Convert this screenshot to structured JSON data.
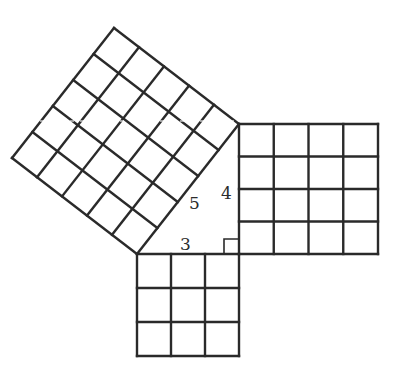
{
  "diagram": {
    "title": "",
    "type": "pythagorean-theorem-squares",
    "colors": {
      "line": "#2a2a2a",
      "background": "#ffffff",
      "faint_band": "#bdbdbd"
    },
    "triangle": {
      "vertices": {
        "right_angle": [
          239,
          254
        ],
        "top": [
          239,
          124
        ],
        "left": [
          137,
          254
        ]
      },
      "labels": {
        "short_leg": "3",
        "long_leg": "4",
        "hypotenuse": "5"
      },
      "right_angle_marker": true
    },
    "squares": [
      {
        "name": "square-on-leg-3",
        "side": 3,
        "grid": "3x3",
        "origin": [
          137,
          254
        ],
        "cell_px": 34
      },
      {
        "name": "square-on-leg-4",
        "side": 4,
        "grid": "4x4",
        "origin": [
          239,
          124
        ],
        "cell_px": 34.75
      },
      {
        "name": "square-on-hypotenuse",
        "side": 5,
        "grid": "5x5",
        "corners": [
          [
            137,
            254
          ],
          [
            239,
            124
          ],
          [
            114,
            28
          ],
          [
            12,
            158
          ]
        ]
      }
    ]
  }
}
